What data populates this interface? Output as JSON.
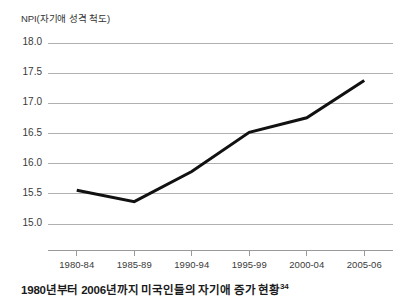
{
  "chart_data": {
    "type": "line",
    "title": "",
    "ylabel": "NPI(자기애 성격 척도)",
    "xlabel": "",
    "categories": [
      "1980-84",
      "1985-89",
      "1990-94",
      "1995-99",
      "2000-04",
      "2005-06"
    ],
    "values": [
      15.56,
      15.37,
      15.87,
      16.52,
      16.76,
      17.38
    ],
    "series": [
      {
        "name": "NPI",
        "values": [
          15.56,
          15.37,
          15.87,
          16.52,
          16.76,
          17.38
        ]
      }
    ],
    "ylim": [
      14.5,
      18.0
    ],
    "yticks": [
      18.0,
      17.5,
      17.0,
      16.5,
      16.0,
      15.5,
      15.0
    ],
    "ytick_labels": [
      "18.0",
      "17.5",
      "17.0",
      "16.5",
      "16.0",
      "15.5",
      "15.0"
    ],
    "grid": true,
    "legend": "none",
    "line_color": "#111111",
    "grid_color": "#b0b0b0",
    "axis_color": "#9a9a9a"
  },
  "caption": {
    "text": "1980년부터 2006년까지 미국인들의 자기애 증가 현황",
    "note_marker": "34"
  }
}
